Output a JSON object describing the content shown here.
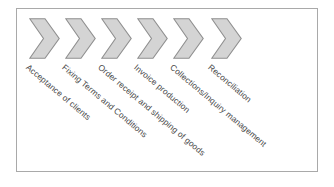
{
  "diagram": {
    "background_color": "#ffffff",
    "frame_border_color": "#a9a9a9",
    "chevron_fill_color": "#d4d4d4",
    "chevron_stroke_color": "#8f8f8f",
    "label_color": "#4a4a4a",
    "label_rotation_degrees": 40,
    "steps": [
      {
        "index": 1,
        "label": "Acceptance of clients",
        "chevron_x": 0,
        "label_x": 30,
        "label_y": 63
      },
      {
        "index": 2,
        "label": "Fixing Terms and Conditions",
        "chevron_x": 36,
        "label_x": 66,
        "label_y": 63
      },
      {
        "index": 3,
        "label": "Order receipt and shipping of goods",
        "chevron_x": 72,
        "label_x": 102,
        "label_y": 63
      },
      {
        "index": 4,
        "label": "Invoice production",
        "chevron_x": 108,
        "label_x": 138,
        "label_y": 63
      },
      {
        "index": 5,
        "label": "Collections/Inquiry management",
        "chevron_x": 144,
        "label_x": 174,
        "label_y": 63
      },
      {
        "index": 6,
        "label": "Reconciliation",
        "chevron_x": 182,
        "label_x": 212,
        "label_y": 63
      }
    ]
  }
}
